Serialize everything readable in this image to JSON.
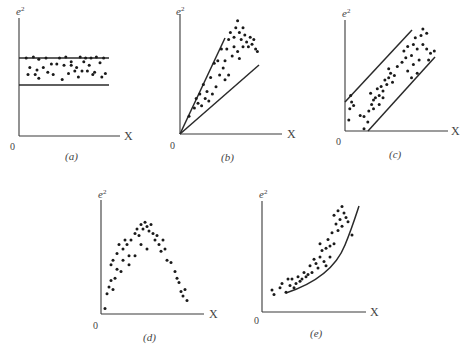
{
  "figure": {
    "panels": [
      {
        "id": "a",
        "caption": "(a)",
        "ylabel": "e",
        "ylabel_sup": "2",
        "xlabel": "X",
        "origin_label": "0"
      },
      {
        "id": "b",
        "caption": "(b)",
        "ylabel": "e",
        "ylabel_sup": "2",
        "xlabel": "X",
        "origin_label": "0"
      },
      {
        "id": "c",
        "caption": "(c)",
        "ylabel": "e",
        "ylabel_sup": "2",
        "xlabel": "X",
        "origin_label": "0"
      },
      {
        "id": "d",
        "caption": "(d)",
        "ylabel": "e",
        "ylabel_sup": "2",
        "xlabel": "X",
        "origin_label": "0"
      },
      {
        "id": "e",
        "caption": "(e)",
        "ylabel": "e",
        "ylabel_sup": "2",
        "xlabel": "X",
        "origin_label": "0"
      }
    ]
  },
  "chart_data": [
    {
      "type": "scatter",
      "panel": "a",
      "title": "(a)",
      "xlabel": "X",
      "ylabel": "e^2",
      "pattern": "constant variance — horizontal band",
      "band": {
        "upper": 0.72,
        "lower": 0.46
      },
      "points": [
        [
          0.08,
          0.66
        ],
        [
          0.16,
          0.67
        ],
        [
          0.22,
          0.65
        ],
        [
          0.3,
          0.66
        ],
        [
          0.45,
          0.66
        ],
        [
          0.52,
          0.67
        ],
        [
          0.68,
          0.67
        ],
        [
          0.74,
          0.66
        ],
        [
          0.8,
          0.66
        ],
        [
          0.86,
          0.67
        ],
        [
          0.94,
          0.66
        ],
        [
          0.12,
          0.58
        ],
        [
          0.2,
          0.56
        ],
        [
          0.27,
          0.58
        ],
        [
          0.36,
          0.61
        ],
        [
          0.42,
          0.61
        ],
        [
          0.5,
          0.6
        ],
        [
          0.58,
          0.6
        ],
        [
          0.64,
          0.58
        ],
        [
          0.72,
          0.63
        ],
        [
          0.78,
          0.6
        ],
        [
          0.9,
          0.62
        ],
        [
          0.1,
          0.52
        ],
        [
          0.18,
          0.52
        ],
        [
          0.32,
          0.54
        ],
        [
          0.55,
          0.53
        ],
        [
          0.62,
          0.55
        ],
        [
          0.7,
          0.55
        ],
        [
          0.76,
          0.55
        ],
        [
          0.84,
          0.54
        ],
        [
          0.96,
          0.53
        ],
        [
          0.22,
          0.49
        ],
        [
          0.48,
          0.48
        ],
        [
          0.66,
          0.5
        ],
        [
          0.82,
          0.52
        ],
        [
          0.92,
          0.5
        ],
        [
          0.38,
          0.52
        ],
        [
          0.58,
          0.63
        ]
      ]
    },
    {
      "type": "scatter",
      "panel": "b",
      "title": "(b)",
      "xlabel": "X",
      "ylabel": "e^2",
      "pattern": "variance increasing linearly with X — fan/wedge",
      "bounds": [
        {
          "slope": 2.14
        },
        {
          "slope": 0.87
        }
      ],
      "points": [
        [
          0.1,
          0.15
        ],
        [
          0.16,
          0.22
        ],
        [
          0.2,
          0.26
        ],
        [
          0.18,
          0.3
        ],
        [
          0.24,
          0.24
        ],
        [
          0.22,
          0.34
        ],
        [
          0.28,
          0.3
        ],
        [
          0.3,
          0.36
        ],
        [
          0.26,
          0.42
        ],
        [
          0.32,
          0.28
        ],
        [
          0.36,
          0.34
        ],
        [
          0.34,
          0.48
        ],
        [
          0.4,
          0.4
        ],
        [
          0.44,
          0.5
        ],
        [
          0.38,
          0.6
        ],
        [
          0.42,
          0.62
        ],
        [
          0.48,
          0.56
        ],
        [
          0.5,
          0.62
        ],
        [
          0.46,
          0.72
        ],
        [
          0.52,
          0.72
        ],
        [
          0.54,
          0.8
        ],
        [
          0.56,
          0.86
        ],
        [
          0.6,
          0.82
        ],
        [
          0.62,
          0.9
        ],
        [
          0.64,
          0.96
        ],
        [
          0.66,
          0.86
        ],
        [
          0.68,
          0.8
        ],
        [
          0.7,
          0.9
        ],
        [
          0.72,
          0.84
        ],
        [
          0.74,
          0.78
        ],
        [
          0.76,
          0.74
        ],
        [
          0.78,
          0.82
        ],
        [
          0.8,
          0.76
        ],
        [
          0.82,
          0.8
        ],
        [
          0.84,
          0.72
        ],
        [
          0.86,
          0.7
        ],
        [
          0.6,
          0.74
        ],
        [
          0.64,
          0.7
        ],
        [
          0.7,
          0.74
        ],
        [
          0.66,
          0.64
        ],
        [
          0.58,
          0.66
        ],
        [
          0.54,
          0.5
        ],
        [
          0.5,
          0.46
        ]
      ]
    },
    {
      "type": "scatter",
      "panel": "c",
      "title": "(c)",
      "xlabel": "X",
      "ylabel": "e^2",
      "pattern": "linear trend with constant spread — parallel diagonal band",
      "bounds": [
        {
          "intercept": 0.27,
          "slope": 1.0
        },
        {
          "intercept": -0.3,
          "slope": 1.0
        }
      ],
      "points": [
        [
          0.05,
          0.2
        ],
        [
          0.07,
          0.26
        ],
        [
          0.09,
          0.23
        ],
        [
          0.04,
          0.1
        ],
        [
          0.06,
          0.32
        ],
        [
          0.16,
          0.14
        ],
        [
          0.2,
          0.13
        ],
        [
          0.25,
          0.18
        ],
        [
          0.28,
          0.24
        ],
        [
          0.3,
          0.28
        ],
        [
          0.27,
          0.34
        ],
        [
          0.32,
          0.3
        ],
        [
          0.34,
          0.38
        ],
        [
          0.36,
          0.32
        ],
        [
          0.38,
          0.4
        ],
        [
          0.4,
          0.36
        ],
        [
          0.42,
          0.46
        ],
        [
          0.44,
          0.42
        ],
        [
          0.46,
          0.48
        ],
        [
          0.48,
          0.52
        ],
        [
          0.5,
          0.44
        ],
        [
          0.52,
          0.5
        ],
        [
          0.46,
          0.56
        ],
        [
          0.4,
          0.3
        ],
        [
          0.36,
          0.24
        ],
        [
          0.3,
          0.2
        ],
        [
          0.55,
          0.58
        ],
        [
          0.6,
          0.62
        ],
        [
          0.62,
          0.72
        ],
        [
          0.64,
          0.66
        ],
        [
          0.66,
          0.76
        ],
        [
          0.7,
          0.68
        ],
        [
          0.72,
          0.78
        ],
        [
          0.74,
          0.84
        ],
        [
          0.76,
          0.74
        ],
        [
          0.8,
          0.86
        ],
        [
          0.82,
          0.78
        ],
        [
          0.86,
          0.74
        ],
        [
          0.9,
          0.7
        ],
        [
          0.94,
          0.72
        ],
        [
          0.88,
          0.64
        ],
        [
          0.78,
          0.64
        ],
        [
          0.72,
          0.6
        ],
        [
          0.66,
          0.54
        ],
        [
          0.7,
          0.48
        ],
        [
          0.76,
          0.52
        ],
        [
          0.82,
          0.92
        ],
        [
          0.86,
          0.88
        ],
        [
          0.2,
          0.02
        ],
        [
          0.24,
          0.08
        ]
      ]
    },
    {
      "type": "scatter",
      "panel": "d",
      "title": "(d)",
      "xlabel": "X",
      "ylabel": "e^2",
      "pattern": "quadratic/inverted-U relationship",
      "points": [
        [
          0.04,
          0.05
        ],
        [
          0.06,
          0.18
        ],
        [
          0.08,
          0.24
        ],
        [
          0.1,
          0.3
        ],
        [
          0.12,
          0.22
        ],
        [
          0.14,
          0.32
        ],
        [
          0.1,
          0.44
        ],
        [
          0.12,
          0.48
        ],
        [
          0.16,
          0.54
        ],
        [
          0.18,
          0.62
        ],
        [
          0.22,
          0.58
        ],
        [
          0.24,
          0.66
        ],
        [
          0.26,
          0.62
        ],
        [
          0.22,
          0.48
        ],
        [
          0.28,
          0.52
        ],
        [
          0.3,
          0.66
        ],
        [
          0.34,
          0.72
        ],
        [
          0.36,
          0.76
        ],
        [
          0.38,
          0.7
        ],
        [
          0.4,
          0.8
        ],
        [
          0.42,
          0.76
        ],
        [
          0.44,
          0.82
        ],
        [
          0.46,
          0.78
        ],
        [
          0.48,
          0.74
        ],
        [
          0.5,
          0.8
        ],
        [
          0.52,
          0.72
        ],
        [
          0.54,
          0.66
        ],
        [
          0.56,
          0.7
        ],
        [
          0.58,
          0.62
        ],
        [
          0.6,
          0.56
        ],
        [
          0.62,
          0.66
        ],
        [
          0.64,
          0.58
        ],
        [
          0.66,
          0.48
        ],
        [
          0.7,
          0.46
        ],
        [
          0.74,
          0.38
        ],
        [
          0.76,
          0.32
        ],
        [
          0.78,
          0.28
        ],
        [
          0.8,
          0.2
        ],
        [
          0.82,
          0.16
        ],
        [
          0.84,
          0.22
        ],
        [
          0.86,
          0.12
        ],
        [
          0.46,
          0.58
        ],
        [
          0.4,
          0.62
        ],
        [
          0.34,
          0.52
        ],
        [
          0.28,
          0.44
        ],
        [
          0.2,
          0.38
        ],
        [
          0.16,
          0.4
        ]
      ]
    },
    {
      "type": "scatter",
      "panel": "e",
      "title": "(e)",
      "xlabel": "X",
      "ylabel": "e^2",
      "pattern": "nonlinear (convex/exponential) relationship with fitted curve",
      "points": [
        [
          0.1,
          0.2
        ],
        [
          0.12,
          0.16
        ],
        [
          0.18,
          0.22
        ],
        [
          0.2,
          0.26
        ],
        [
          0.24,
          0.18
        ],
        [
          0.26,
          0.3
        ],
        [
          0.28,
          0.24
        ],
        [
          0.3,
          0.3
        ],
        [
          0.32,
          0.22
        ],
        [
          0.34,
          0.26
        ],
        [
          0.36,
          0.32
        ],
        [
          0.38,
          0.28
        ],
        [
          0.4,
          0.3
        ],
        [
          0.42,
          0.36
        ],
        [
          0.44,
          0.32
        ],
        [
          0.46,
          0.34
        ],
        [
          0.48,
          0.42
        ],
        [
          0.5,
          0.36
        ],
        [
          0.52,
          0.48
        ],
        [
          0.54,
          0.44
        ],
        [
          0.56,
          0.4
        ],
        [
          0.58,
          0.5
        ],
        [
          0.6,
          0.56
        ],
        [
          0.62,
          0.46
        ],
        [
          0.64,
          0.58
        ],
        [
          0.66,
          0.66
        ],
        [
          0.68,
          0.6
        ],
        [
          0.7,
          0.72
        ],
        [
          0.72,
          0.62
        ],
        [
          0.74,
          0.8
        ],
        [
          0.76,
          0.74
        ],
        [
          0.78,
          0.84
        ],
        [
          0.8,
          0.78
        ],
        [
          0.82,
          0.9
        ],
        [
          0.84,
          0.86
        ],
        [
          0.72,
          0.88
        ],
        [
          0.76,
          0.92
        ],
        [
          0.8,
          0.96
        ],
        [
          0.86,
          0.82
        ],
        [
          0.9,
          0.7
        ],
        [
          0.68,
          0.5
        ],
        [
          0.64,
          0.42
        ],
        [
          0.58,
          0.62
        ]
      ],
      "fit_curve": "convex, rising steeply at high X"
    }
  ]
}
